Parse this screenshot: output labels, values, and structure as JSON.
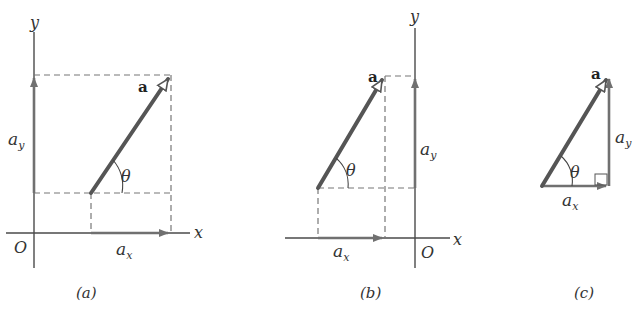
{
  "figure": {
    "panels": [
      {
        "id": "a",
        "caption": "(a)",
        "vector_label": "a",
        "angle_label": "θ",
        "x_axis_label": "x",
        "y_axis_label": "y",
        "origin_label": "O",
        "x_component_label": "a",
        "x_component_sub": "x",
        "y_component_label": "a",
        "y_component_sub": "y"
      },
      {
        "id": "b",
        "caption": "(b)",
        "vector_label": "a",
        "angle_label": "θ",
        "x_axis_label": "x",
        "y_axis_label": "y",
        "origin_label": "O",
        "x_component_label": "a",
        "x_component_sub": "x",
        "y_component_label": "a",
        "y_component_sub": "y"
      },
      {
        "id": "c",
        "caption": "(c)",
        "vector_label": "a",
        "angle_label": "θ",
        "x_component_label": "a",
        "x_component_sub": "x",
        "y_component_label": "a",
        "y_component_sub": "y"
      }
    ],
    "colors": {
      "vector": "#555555",
      "component": "#707070",
      "axis": "#4a4a4a",
      "dashed": "#777777",
      "background": "#ffffff"
    }
  }
}
